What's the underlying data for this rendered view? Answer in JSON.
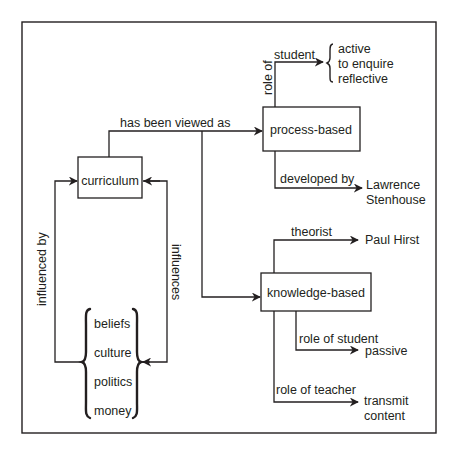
{
  "diagram": {
    "colors": {
      "ink": "#231f20",
      "background": "#ffffff"
    },
    "nodes": {
      "curriculum": {
        "label": "curriculum"
      },
      "process_based": {
        "label": "process-based"
      },
      "knowledge_based": {
        "label": "knowledge-based"
      },
      "influences_group": {
        "items": [
          "beliefs",
          "culture",
          "politics",
          "money"
        ]
      },
      "process_student_traits": {
        "items": [
          "active",
          "to enquire",
          "reflective"
        ]
      },
      "lawrence_stenhouse": {
        "lines": [
          "Lawrence",
          "Stenhouse"
        ]
      },
      "paul_hirst": {
        "label": "Paul Hirst"
      },
      "passive": {
        "label": "passive"
      },
      "transmit_content": {
        "lines": [
          "transmit",
          "content"
        ]
      }
    },
    "edges": {
      "has_been_viewed_as": {
        "label": "has been viewed as",
        "from": "curriculum",
        "to": [
          "process-based",
          "knowledge-based"
        ]
      },
      "role_of": {
        "label": "role of",
        "from": "process-based"
      },
      "student": {
        "label": "student",
        "to": "active / to enquire / reflective"
      },
      "developed_by": {
        "label": "developed by",
        "from": "process-based",
        "to": "Lawrence Stenhouse"
      },
      "theorist": {
        "label": "theorist",
        "from": "knowledge-based",
        "to": "Paul Hirst"
      },
      "role_of_student": {
        "label": "role of student",
        "from": "knowledge-based",
        "to": "passive"
      },
      "role_of_teacher": {
        "label": "role of teacher",
        "from": "knowledge-based",
        "to": "transmit content"
      },
      "influenced_by": {
        "label": "influenced by",
        "from": "beliefs/culture/politics/money",
        "to": "curriculum"
      },
      "influences": {
        "label": "influences",
        "from": "curriculum",
        "to": "beliefs/culture/politics/money"
      }
    }
  }
}
